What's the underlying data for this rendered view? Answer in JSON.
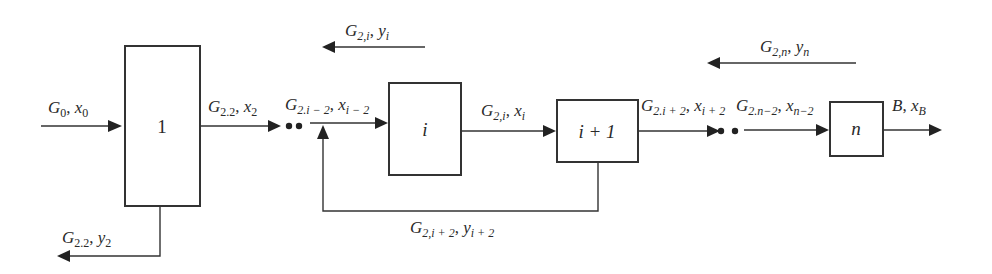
{
  "diagram": {
    "type": "multistage process flow (countercurrent cascade with recycle)",
    "colors": {
      "stroke": "#333333",
      "background": "#ffffff"
    },
    "stages": [
      {
        "id": "stage-1",
        "label": "1"
      },
      {
        "id": "stage-i",
        "label": "i"
      },
      {
        "id": "stage-i-plus-1",
        "label": "i + 1"
      },
      {
        "id": "stage-n",
        "label": "n"
      }
    ],
    "streams": {
      "feed": {
        "G": "G",
        "G_sub": "0",
        "x": "x",
        "x_sub": "0"
      },
      "stage1_out": {
        "G": "G",
        "G_sub": "2.2",
        "x": "x",
        "x_sub": "2"
      },
      "stage1_bottom": {
        "G": "G",
        "G_sub": "2.2",
        "y": "y",
        "y_sub": "2"
      },
      "into_i": {
        "G": "G",
        "G_sub": "2.i − 2",
        "x": "x",
        "x_sub": "i − 2"
      },
      "i_top": {
        "G": "G",
        "G_sub": "2,i",
        "y": "y",
        "y_sub": "i"
      },
      "i_out": {
        "G": "G",
        "G_sub": "2,i",
        "x": "x",
        "x_sub": "i"
      },
      "recycle": {
        "G": "G",
        "G_sub": "2,i + 2",
        "y": "y",
        "y_sub": "i + 2"
      },
      "iplus1_out": {
        "G": "G",
        "G_sub": "2.i + 2",
        "x": "x",
        "x_sub": "i + 2"
      },
      "into_n": {
        "G": "G",
        "G_sub": "2.n−2",
        "x": "x",
        "x_sub": "n−2"
      },
      "n_top": {
        "G": "G",
        "G_sub": "2,n",
        "y": "y",
        "y_sub": "n"
      },
      "product": {
        "B": "B",
        "x": "x",
        "x_sub": "B"
      }
    },
    "separator": ", "
  }
}
